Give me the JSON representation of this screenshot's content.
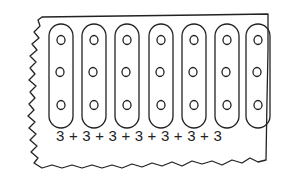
{
  "illustration": {
    "subject": "paper strip with grouped dots",
    "groups": [
      {
        "label": "group-1",
        "dots": 3
      },
      {
        "label": "group-2",
        "dots": 3
      },
      {
        "label": "group-3",
        "dots": 3
      },
      {
        "label": "group-4",
        "dots": 3
      },
      {
        "label": "group-5",
        "dots": 3
      },
      {
        "label": "group-6",
        "dots": 3
      },
      {
        "label": "group-7",
        "dots": 3
      }
    ],
    "equation": "3 + 3 + 3 + 3 + 3 + 3 + 3",
    "ink_color": "#222222",
    "background_color": "#ffffff"
  }
}
